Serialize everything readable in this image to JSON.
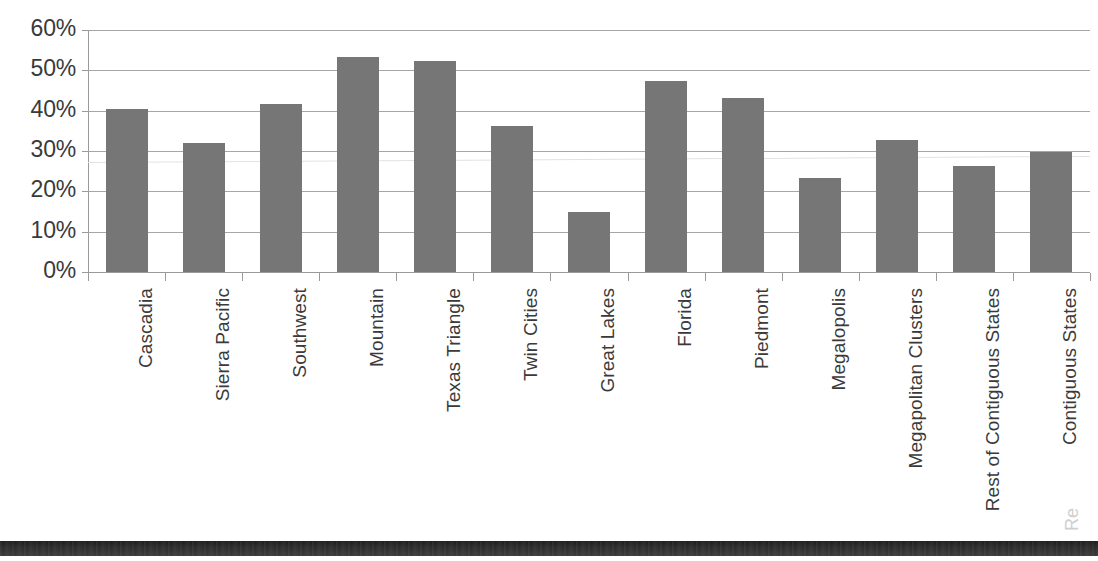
{
  "chart_data": {
    "type": "bar",
    "title": "",
    "xlabel": "",
    "ylabel": "",
    "ylim": [
      0,
      60
    ],
    "grid": true,
    "legend": "none",
    "y_unit": "%",
    "y_ticks": [
      "0%",
      "10%",
      "20%",
      "30%",
      "40%",
      "50%",
      "60%"
    ],
    "y_tick_values": [
      0,
      10,
      20,
      30,
      40,
      50,
      60
    ],
    "categories": [
      "Cascadia",
      "Sierra Pacific",
      "Southwest",
      "Mountain",
      "Texas Triangle",
      "Twin Cities",
      "Great Lakes",
      "Florida",
      "Piedmont",
      "Megalopolis",
      "Megapolitan Clusters",
      "Rest of Contiguous States",
      "Contiguous States"
    ],
    "values": [
      40.5,
      32.0,
      41.7,
      53.3,
      52.3,
      36.3,
      15.0,
      47.4,
      43.2,
      23.2,
      32.8,
      26.2,
      29.7
    ],
    "series": [
      {
        "name": "",
        "values": [
          40.5,
          32.0,
          41.7,
          53.3,
          52.3,
          36.3,
          15.0,
          47.4,
          43.2,
          23.2,
          32.8,
          26.2,
          29.7
        ]
      }
    ],
    "bar_color": "#767676",
    "gridline_color": "#a6a6a6",
    "axis_color": "#9a9a9a",
    "text_color": "#3a3a3a"
  },
  "artifacts": {
    "margin_fragment": "Re"
  }
}
